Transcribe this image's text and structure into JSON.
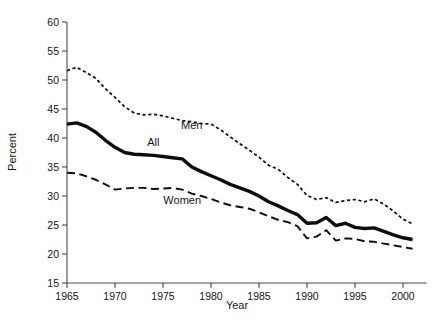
{
  "chart_data": {
    "type": "line",
    "title": "",
    "xlabel": "Year",
    "ylabel": "Percent",
    "xlim": [
      1965,
      2001
    ],
    "ylim": [
      15,
      60
    ],
    "xticks": [
      1965,
      1970,
      1975,
      1980,
      1985,
      1990,
      1995,
      2000
    ],
    "yticks": [
      15,
      20,
      25,
      30,
      35,
      40,
      45,
      50,
      55,
      60
    ],
    "xtick_labels": [
      "1965",
      "1970",
      "1975",
      "1980",
      "1985",
      "1990",
      "1995",
      "2000"
    ],
    "ytick_labels": [
      "15",
      "20",
      "25",
      "30",
      "35",
      "40",
      "45",
      "50",
      "55",
      "60"
    ],
    "grid": false,
    "legend": "inline-annotations",
    "x": [
      1965,
      1966,
      1967,
      1968,
      1969,
      1970,
      1971,
      1972,
      1973,
      1974,
      1975,
      1976,
      1977,
      1978,
      1979,
      1980,
      1981,
      1982,
      1983,
      1984,
      1985,
      1986,
      1987,
      1988,
      1989,
      1990,
      1991,
      1992,
      1993,
      1994,
      1995,
      1996,
      1997,
      1998,
      1999,
      2000,
      2001
    ],
    "series": [
      {
        "name": "Men",
        "style": "dotted",
        "label_x": 1978,
        "label_y": 41.5,
        "values": [
          51.6,
          52.2,
          51.3,
          50.3,
          48.5,
          47.0,
          45.4,
          44.3,
          44.0,
          44.1,
          43.8,
          43.4,
          43.0,
          42.8,
          42.5,
          42.4,
          41.4,
          40.2,
          39.0,
          37.9,
          36.7,
          35.3,
          34.6,
          33.2,
          32.0,
          30.1,
          29.4,
          29.7,
          28.9,
          29.2,
          29.4,
          29.0,
          29.5,
          28.6,
          27.4,
          26.0,
          25.2
        ]
      },
      {
        "name": "All",
        "style": "solid",
        "label_x": 1974,
        "label_y": 38.6,
        "values": [
          42.4,
          42.6,
          42.0,
          41.0,
          39.6,
          38.4,
          37.5,
          37.2,
          37.1,
          37.0,
          36.8,
          36.6,
          36.4,
          35.0,
          34.2,
          33.5,
          32.8,
          32.0,
          31.4,
          30.8,
          30.0,
          29.0,
          28.3,
          27.5,
          26.8,
          25.3,
          25.4,
          26.3,
          24.9,
          25.3,
          24.6,
          24.4,
          24.5,
          23.9,
          23.3,
          22.8,
          22.5
        ]
      },
      {
        "name": "Women",
        "style": "dashed",
        "label_x": 1977,
        "label_y": 28.6,
        "values": [
          34.0,
          33.9,
          33.4,
          32.8,
          32.0,
          31.1,
          31.3,
          31.4,
          31.4,
          31.2,
          31.3,
          31.4,
          31.1,
          30.4,
          30.0,
          29.5,
          28.9,
          28.4,
          28.1,
          27.8,
          27.2,
          26.5,
          25.9,
          25.5,
          24.8,
          22.7,
          23.0,
          24.1,
          22.3,
          22.7,
          22.6,
          22.2,
          22.1,
          21.8,
          21.5,
          21.2,
          20.9
        ]
      }
    ]
  },
  "axes": {
    "ylabel": "Percent",
    "xlabel": "Year"
  }
}
